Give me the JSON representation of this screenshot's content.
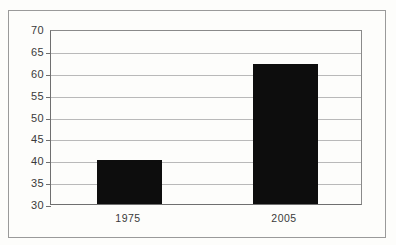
{
  "chart_data": {
    "type": "bar",
    "title": "",
    "subtitle": "",
    "xlabel": "",
    "ylabel": "",
    "categories": [
      "1975",
      "2005"
    ],
    "values": [
      40,
      62
    ],
    "series": [
      {
        "name": "",
        "values": [
          40,
          62
        ]
      }
    ],
    "ylim": [
      30,
      70
    ],
    "ytick_step": 5,
    "yticks": [
      30,
      35,
      40,
      45,
      50,
      55,
      60,
      65,
      70
    ],
    "ytick_labels": [
      "30",
      "35",
      "40",
      "45",
      "50",
      "55",
      "60",
      "65",
      "70"
    ],
    "grid": true,
    "grid_axis": "y",
    "legend": false,
    "legend_position": "none",
    "bar_color": "#0d0d0d",
    "gridline_color": "#b9b9b9",
    "axis_color": "#6f6f6f",
    "frame_color": "#9a9a9a",
    "background_color": "#fdfdfb"
  }
}
